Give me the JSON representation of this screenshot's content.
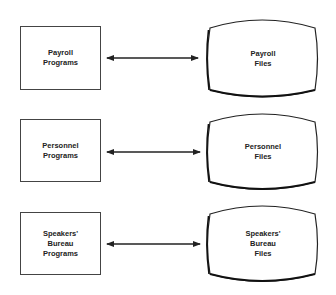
{
  "rows": [
    {
      "program": {
        "label": "Payroll\nPrograms"
      },
      "file": {
        "label": "Payroll\nFiles"
      },
      "connector": "bidirectional-arrow"
    },
    {
      "program": {
        "label": "Personnel\nPrograms"
      },
      "file": {
        "label": "Personnel\nFiles"
      },
      "connector": "bidirectional-arrow"
    },
    {
      "program": {
        "label": "Speakers'\nBureau\nPrograms"
      },
      "file": {
        "label": "Speakers'\nBureau\nFiles"
      },
      "connector": "bidirectional-arrow"
    }
  ],
  "colors": {
    "stroke": "#333333",
    "background": "#ffffff",
    "text": "#222222"
  }
}
